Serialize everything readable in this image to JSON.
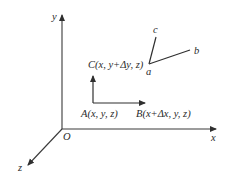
{
  "diagram": {
    "axes": {
      "x_label": "x",
      "y_label": "y",
      "z_label": "z",
      "origin_label": "O"
    },
    "points": {
      "A": "A(x, y, z)",
      "B": "B(x+Δx, y, z)",
      "C": "C(x, y+Δy, z)"
    },
    "deformed": {
      "a": "a",
      "b": "b",
      "c": "c"
    },
    "colors": {
      "line": "#2f2f2f",
      "background": "#ffffff"
    }
  }
}
